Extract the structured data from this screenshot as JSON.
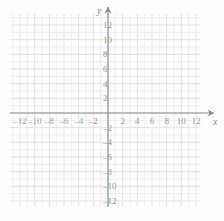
{
  "chart_data": {
    "type": "scatter",
    "title": "",
    "subtitle": "",
    "xlabel": "x",
    "ylabel": "y",
    "xlim": [
      -13,
      13
    ],
    "ylim": [
      -13,
      13
    ],
    "grid": true,
    "grid_step": 1,
    "tick_step": 2,
    "legend": null,
    "series": [],
    "annotations": [],
    "x_ticks": [
      {
        "value": -12,
        "label": "–12"
      },
      {
        "value": -10,
        "label": "–10"
      },
      {
        "value": -8,
        "label": "–8"
      },
      {
        "value": -6,
        "label": "–6"
      },
      {
        "value": -4,
        "label": "–4"
      },
      {
        "value": -2,
        "label": "–2"
      },
      {
        "value": 2,
        "label": "2"
      },
      {
        "value": 4,
        "label": "4"
      },
      {
        "value": 6,
        "label": "6"
      },
      {
        "value": 8,
        "label": "8"
      },
      {
        "value": 10,
        "label": "10"
      },
      {
        "value": 12,
        "label": "12"
      }
    ],
    "y_ticks": [
      {
        "value": 12,
        "label": "12"
      },
      {
        "value": 10,
        "label": "10"
      },
      {
        "value": 8,
        "label": "8"
      },
      {
        "value": 6,
        "label": "6"
      },
      {
        "value": 4,
        "label": "4"
      },
      {
        "value": 2,
        "label": "2"
      },
      {
        "value": -2,
        "label": "–2"
      },
      {
        "value": -4,
        "label": "–4"
      },
      {
        "value": -6,
        "label": "–6"
      },
      {
        "value": -8,
        "label": "–8"
      },
      {
        "value": -10,
        "label": "–10"
      },
      {
        "value": -12,
        "label": "–12"
      }
    ],
    "colors": {
      "background": "#fdfdfd",
      "grid_minor": "#ededed",
      "grid_major": "#e3e3e3",
      "axis": "#8a8a8a",
      "tick_text": "#9a9a9a",
      "axis_name": "#8f8f8f"
    }
  },
  "axis_labels": {
    "x": "x",
    "y": "y"
  }
}
